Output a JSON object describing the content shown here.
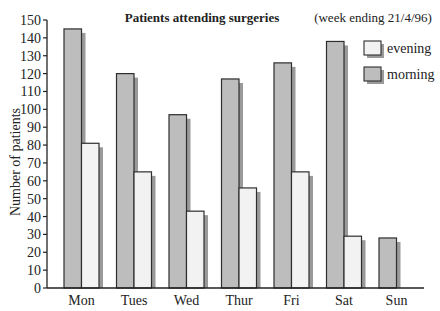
{
  "chart_data": {
    "type": "bar",
    "title": "Patients attending surgeries",
    "subtitle": "(week ending 21/4/96)",
    "xlabel": "",
    "ylabel": "Number of patients",
    "ylim": [
      0,
      150
    ],
    "yticks": [
      0,
      10,
      20,
      30,
      40,
      50,
      60,
      70,
      80,
      90,
      100,
      110,
      120,
      130,
      140,
      150
    ],
    "grid": false,
    "legend_position": "upper right",
    "categories": [
      "Mon",
      "Tues",
      "Wed",
      "Thur",
      "Fri",
      "Sat",
      "Sun"
    ],
    "series": [
      {
        "name": "morning",
        "values": [
          145,
          120,
          97,
          117,
          126,
          138,
          28
        ],
        "color": "#bdbdbd"
      },
      {
        "name": "evening",
        "values": [
          81,
          65,
          43,
          56,
          65,
          29,
          null
        ],
        "color": "#f2f2f2"
      }
    ],
    "legend": [
      {
        "label": "evening",
        "color": "#f2f2f2"
      },
      {
        "label": "morning",
        "color": "#bdbdbd"
      }
    ]
  },
  "colors": {
    "outline": "#2e2e2e",
    "shadow": "#9a9a9a",
    "axis": "#222222"
  }
}
